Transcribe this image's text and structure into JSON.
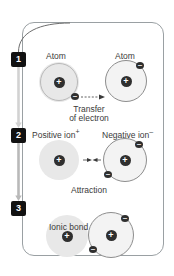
{
  "diagram": {
    "frame_color": "#9aa0a3",
    "badge_color": "#111111",
    "nucleus_color": "#2f2f2f",
    "electron_color": "#2f2f2f",
    "shaded_fill": "#e8e8e8",
    "ring_fill": "#f3f3f3"
  },
  "stages": [
    {
      "number": "1",
      "left_particle_label": "Atom",
      "right_particle_label": "Atom",
      "left_nucleus": "+",
      "right_nucleus": "+",
      "left_electrons": 1,
      "right_electrons": 1,
      "caption_line1": "Transfer",
      "caption_line2": "of electron"
    },
    {
      "number": "2",
      "left_particle_label": "Positive ion",
      "left_particle_charge": "+",
      "right_particle_label": "Negative ion",
      "right_particle_charge": "–",
      "left_nucleus": "+",
      "right_nucleus": "+",
      "left_electrons": 0,
      "right_electrons": 2,
      "caption_line1": "Attraction",
      "caption_line2": ""
    },
    {
      "number": "3",
      "left_particle_label": "",
      "right_particle_label": "",
      "bond_label": "Ionic bond",
      "left_nucleus": "+",
      "right_nucleus": "+",
      "left_electrons": 0,
      "right_electrons": 2,
      "caption_line1": "",
      "caption_line2": ""
    }
  ],
  "electron_glyph": "–"
}
